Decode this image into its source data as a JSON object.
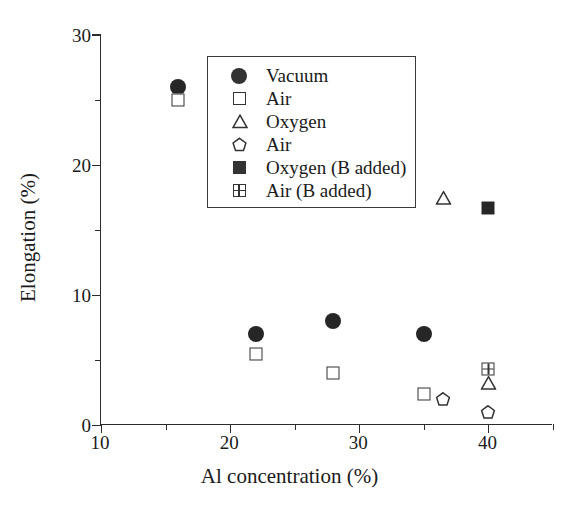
{
  "chart_data": {
    "type": "scatter",
    "title": "",
    "xlabel": "Al concentration (%)",
    "ylabel": "Elongation (%)",
    "xlim": [
      10,
      45
    ],
    "ylim": [
      0,
      30
    ],
    "x_ticks": [
      10,
      20,
      30,
      40
    ],
    "x_tick_labels": [
      "10",
      "20",
      "30",
      "40"
    ],
    "x_minor_ticks": [
      15,
      25,
      35,
      45
    ],
    "y_ticks": [
      0,
      10,
      20,
      30
    ],
    "y_tick_labels": [
      "0",
      "10",
      "20",
      "30"
    ],
    "y_minor_ticks": [
      5,
      15,
      25
    ],
    "grid": false,
    "legend_position": "upper center",
    "series": [
      {
        "name": "Vacuum",
        "marker": "filled-circle",
        "color": "#262626",
        "points": [
          {
            "x": 16.0,
            "y": 26.0
          },
          {
            "x": 22.0,
            "y": 7.0
          },
          {
            "x": 28.0,
            "y": 8.0
          },
          {
            "x": 35.0,
            "y": 7.0
          }
        ]
      },
      {
        "name": "Air",
        "marker": "open-square",
        "color": "#333333",
        "points": [
          {
            "x": 16.0,
            "y": 25.0
          },
          {
            "x": 22.0,
            "y": 5.5
          },
          {
            "x": 28.0,
            "y": 4.0
          },
          {
            "x": 35.0,
            "y": 2.4
          }
        ]
      },
      {
        "name": "Oxygen",
        "marker": "open-triangle",
        "color": "#333333",
        "points": [
          {
            "x": 36.5,
            "y": 17.5
          },
          {
            "x": 40.0,
            "y": 3.2
          }
        ]
      },
      {
        "name": "Air",
        "marker": "open-pentagon",
        "color": "#333333",
        "points": [
          {
            "x": 36.5,
            "y": 2.0
          },
          {
            "x": 40.0,
            "y": 1.0
          }
        ]
      },
      {
        "name": "Oxygen (B added)",
        "marker": "filled-square",
        "color": "#262626",
        "points": [
          {
            "x": 40.0,
            "y": 16.7
          }
        ]
      },
      {
        "name": "Air (B added)",
        "marker": "grid-square",
        "color": "#333333",
        "points": [
          {
            "x": 40.0,
            "y": 4.3
          }
        ]
      }
    ],
    "legend": [
      {
        "label": "Vacuum",
        "marker": "filled-circle"
      },
      {
        "label": "Air",
        "marker": "open-square"
      },
      {
        "label": "Oxygen",
        "marker": "open-triangle"
      },
      {
        "label": "Air",
        "marker": "open-pentagon"
      },
      {
        "label": "Oxygen (B added)",
        "marker": "filled-square"
      },
      {
        "label": "Air (B added)",
        "marker": "grid-square"
      }
    ]
  }
}
